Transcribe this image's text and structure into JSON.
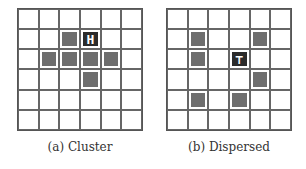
{
  "figures": [
    {
      "id": "a",
      "caption": "(a) Cluster",
      "rows": 6,
      "cols": 6,
      "gray_cells": [
        [
          1,
          2
        ],
        [
          2,
          1
        ],
        [
          2,
          2
        ],
        [
          2,
          3
        ],
        [
          2,
          4
        ],
        [
          3,
          3
        ]
      ],
      "dark_cells": [
        [
          1,
          3
        ]
      ],
      "agent_glyph": "H"
    },
    {
      "id": "b",
      "caption": "(b) Dispersed",
      "rows": 6,
      "cols": 6,
      "gray_cells": [
        [
          1,
          1
        ],
        [
          1,
          4
        ],
        [
          2,
          1
        ],
        [
          3,
          4
        ],
        [
          4,
          1
        ],
        [
          4,
          3
        ]
      ],
      "dark_cells": [
        [
          2,
          3
        ]
      ],
      "agent_glyph": "⊤"
    }
  ],
  "colors": {
    "gray": "#6e6e6e",
    "dark": "#2b2b2b",
    "line": "#666666"
  }
}
